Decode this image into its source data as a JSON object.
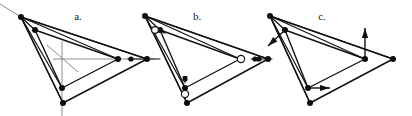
{
  "figure": {
    "caption_labels": [
      "a.",
      "b.",
      "c."
    ],
    "background_color": "#ffffff",
    "line_color": "#121212",
    "axis_color": "#8c8c8c",
    "marker_fill_color": "#0d0d0d",
    "open_marker_fill": "#ffffff",
    "width_px": 412,
    "height_px": 116
  },
  "panels": [
    {
      "id": "panel-a",
      "label": "a.",
      "label_x": 78,
      "label_y": 20,
      "description": "Outer triangle with inner triangle and gray coordinate crosshair",
      "outer_triangle": [
        [
          21,
          17
        ],
        [
          147,
          59
        ],
        [
          63,
          103
        ]
      ],
      "inner_triangle": [
        [
          35,
          30
        ],
        [
          118,
          59
        ],
        [
          62,
          88
        ]
      ],
      "apex": [
        21,
        17
      ],
      "connector_targets": [
        [
          35,
          30
        ],
        [
          118,
          59
        ],
        [
          62,
          88
        ],
        [
          63,
          103
        ],
        [
          147,
          59
        ]
      ],
      "vertices": [
        {
          "x": 21,
          "y": 17,
          "type": "filled",
          "r": 3.0
        },
        {
          "x": 147,
          "y": 59,
          "type": "filled",
          "r": 3.0
        },
        {
          "x": 63,
          "y": 103,
          "type": "filled",
          "r": 3.0
        },
        {
          "x": 35,
          "y": 30,
          "type": "filled",
          "r": 3.0
        },
        {
          "x": 118,
          "y": 59,
          "type": "filled",
          "r": 3.0
        },
        {
          "x": 62,
          "y": 88,
          "type": "filled",
          "r": 3.0
        }
      ],
      "axis_lines": [
        {
          "x1": 62,
          "y1": 41,
          "x2": 62,
          "y2": 116
        },
        {
          "x1": 53,
          "y1": 59,
          "x2": 155,
          "y2": 59
        },
        {
          "x1": 47,
          "y1": 45,
          "x2": 78,
          "y2": 72
        },
        {
          "x1": 0,
          "y1": 4,
          "x2": 21,
          "y2": 17
        }
      ],
      "open_circles": [],
      "vector_arrows": [],
      "edge_arrowheads": []
    },
    {
      "id": "panel-b",
      "label": "b.",
      "label_x": 197,
      "label_y": 20,
      "description": "Outer triangle with inner triangle, open-circle midpoint markers and arrowheads along connectors",
      "outer_triangle": [
        [
          145,
          16
        ],
        [
          268,
          59
        ],
        [
          187,
          103
        ]
      ],
      "inner_triangle": [
        [
          160,
          30
        ],
        [
          240,
          59
        ],
        [
          185,
          88
        ]
      ],
      "apex": [
        145,
        16
      ],
      "connector_targets": [
        [
          160,
          30
        ],
        [
          240,
          59
        ],
        [
          185,
          88
        ],
        [
          187,
          103
        ],
        [
          268,
          59
        ]
      ],
      "vertices": [
        {
          "x": 145,
          "y": 16,
          "type": "filled",
          "r": 3.0
        },
        {
          "x": 268,
          "y": 59,
          "type": "filled",
          "r": 3.0
        },
        {
          "x": 187,
          "y": 103,
          "type": "filled",
          "r": 3.0
        },
        {
          "x": 160,
          "y": 30,
          "type": "filled",
          "r": 3.0
        },
        {
          "x": 240,
          "y": 59,
          "type": "filled",
          "r": 3.0
        },
        {
          "x": 185,
          "y": 88,
          "type": "filled",
          "r": 3.0
        }
      ],
      "axis_lines": [
        {
          "x1": 128,
          "y1": 59,
          "x2": 160,
          "y2": 59
        }
      ],
      "open_circles": [
        {
          "x": 155,
          "y": 30,
          "r": 3.4
        },
        {
          "x": 241,
          "y": 59,
          "r": 3.6
        },
        {
          "x": 185,
          "y": 94,
          "r": 3.6
        }
      ],
      "vector_arrows": [],
      "edge_arrowheads": [
        {
          "x": 250,
          "y": 59,
          "angle": 180,
          "size": 4.2
        },
        {
          "x": 166,
          "y": 34,
          "angle": 36,
          "size": 4.0
        },
        {
          "x": 185,
          "y": 84,
          "angle": 90,
          "size": 4.0
        }
      ],
      "marker_dots": [
        {
          "x": 131,
          "y": 59,
          "r": 2.6
        },
        {
          "x": 255,
          "y": 59,
          "r": 2.6
        },
        {
          "x": 185,
          "y": 79,
          "r": 2.6
        }
      ]
    },
    {
      "id": "panel-c",
      "label": "c.",
      "label_x": 322,
      "label_y": 20,
      "description": "Outer triangle with inner triangle and displacement vector arrows at inner vertices",
      "outer_triangle": [
        [
          270,
          16
        ],
        [
          393,
          59
        ],
        [
          310,
          103
        ]
      ],
      "inner_triangle": [
        [
          285,
          30
        ],
        [
          365,
          59
        ],
        [
          308,
          88
        ]
      ],
      "apex": [
        270,
        16
      ],
      "connector_targets": [
        [
          285,
          30
        ],
        [
          365,
          59
        ],
        [
          308,
          88
        ],
        [
          310,
          103
        ],
        [
          393,
          59
        ]
      ],
      "vertices": [
        {
          "x": 270,
          "y": 16,
          "type": "filled",
          "r": 3.0
        },
        {
          "x": 393,
          "y": 59,
          "type": "filled",
          "r": 3.0
        },
        {
          "x": 310,
          "y": 103,
          "type": "filled",
          "r": 3.0
        },
        {
          "x": 285,
          "y": 30,
          "type": "filled",
          "r": 3.0
        },
        {
          "x": 365,
          "y": 59,
          "type": "filled",
          "r": 3.0
        },
        {
          "x": 308,
          "y": 88,
          "type": "filled",
          "r": 3.0
        }
      ],
      "axis_lines": [
        {
          "x1": 255,
          "y1": 59,
          "x2": 272,
          "y2": 59
        }
      ],
      "open_circles": [],
      "vector_arrows": [
        {
          "name": "arrow-up",
          "x1": 365,
          "y1": 59,
          "x2": 365,
          "y2": 28,
          "head": 5.0
        },
        {
          "name": "arrow-down-left",
          "x1": 285,
          "y1": 30,
          "x2": 268,
          "y2": 46,
          "head": 5.0
        },
        {
          "name": "arrow-right",
          "x1": 308,
          "y1": 88,
          "x2": 330,
          "y2": 88,
          "head": 5.0
        }
      ],
      "edge_arrowheads": [],
      "marker_dots": [
        {
          "x": 259,
          "y": 59,
          "r": 2.6
        }
      ]
    }
  ]
}
